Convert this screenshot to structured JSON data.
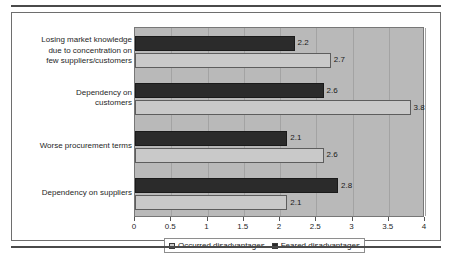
{
  "chart_data": {
    "type": "bar",
    "orientation": "horizontal",
    "title": "",
    "xlabel": "",
    "ylabel": "",
    "xlim": [
      0,
      4
    ],
    "xticks": [
      "0",
      "0.5",
      "1",
      "1.5",
      "2",
      "2.5",
      "3",
      "3.5",
      "4"
    ],
    "xtick_values": [
      0,
      0.5,
      1,
      1.5,
      2,
      2.5,
      3,
      3.5,
      4
    ],
    "grid": true,
    "legend_position": "bottom",
    "categories": [
      "Losing market knowledge\ndue to concentration on\nfew suppliers/customers",
      "Dependency on\ncustomers",
      "Worse procurement terms",
      "Dependency on suppliers"
    ],
    "series": [
      {
        "name": "Occurred disadvantages",
        "color": "#c9c9c9",
        "values": [
          2.7,
          3.8,
          2.6,
          2.1
        ],
        "labels": [
          "2.7",
          "3.8",
          "2.6",
          "2.1"
        ]
      },
      {
        "name": "Feared disadvantages",
        "color": "#2b2b2b",
        "values": [
          2.2,
          2.6,
          2.1,
          2.8
        ],
        "labels": [
          "2.2",
          "2.6",
          "2.1",
          "2.8"
        ]
      }
    ]
  },
  "legend": {
    "entries": [
      {
        "label": "Occurred disadvantages",
        "color": "#c9c9c9"
      },
      {
        "label": "Feared disadvantages",
        "color": "#2b2b2b"
      }
    ]
  },
  "axis": {
    "x_ticks": [
      {
        "label": "0",
        "value": 0
      },
      {
        "label": "0.5",
        "value": 0.5
      },
      {
        "label": "1",
        "value": 1
      },
      {
        "label": "1.5",
        "value": 1.5
      },
      {
        "label": "2",
        "value": 2
      },
      {
        "label": "2.5",
        "value": 2.5
      },
      {
        "label": "3",
        "value": 3
      },
      {
        "label": "3.5",
        "value": 3.5
      },
      {
        "label": "4",
        "value": 4
      }
    ]
  },
  "categories": [
    {
      "label": "Losing market knowledge\ndue to concentration on\nfew suppliers/customers"
    },
    {
      "label": "Dependency on\ncustomers"
    },
    {
      "label": "Worse procurement terms"
    },
    {
      "label": "Dependency on suppliers"
    }
  ]
}
